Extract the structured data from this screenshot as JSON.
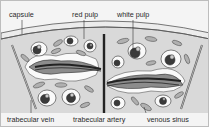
{
  "diagram": {
    "labels": {
      "capsule": "capsule",
      "red_pulp": "red pulp",
      "white_pulp": "white pulp",
      "trabecular_vein": "trabecular vein",
      "trabecular_artery": "trabecular artery",
      "venous_sinus": "venous sinus"
    },
    "colors": {
      "background": "#f4f4f4",
      "tissue": "#d9d9d9",
      "capsule": "#ececec",
      "outline": "#333333",
      "dark_vessel": "#3a3a3a",
      "mid_gray": "#8c8c8c",
      "light_gray": "#c4c4c4"
    }
  }
}
